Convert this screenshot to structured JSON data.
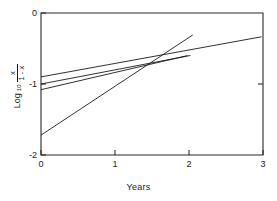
{
  "chart_data": {
    "type": "line",
    "title": "",
    "xlabel": "Years",
    "ylabel": "Log10 x/(1-x)",
    "ylabel_parts": {
      "prefix": "Log",
      "subscript": "10",
      "numerator": "x",
      "denominator": "1 - x"
    },
    "xlim": [
      0,
      3
    ],
    "ylim": [
      -2,
      0
    ],
    "xticks": [
      0,
      1,
      2,
      3
    ],
    "xtick_labels": [
      "0",
      "1",
      "2",
      "3"
    ],
    "yticks": [
      0,
      -1,
      -2
    ],
    "ytick_labels": [
      "0",
      "-1",
      "-2"
    ],
    "grid": false,
    "legend": "none",
    "line_color": "#1a1a1a",
    "series": [
      {
        "name": "line-1",
        "points": [
          [
            0.0,
            -0.9
          ],
          [
            2.98,
            -0.335
          ]
        ]
      },
      {
        "name": "line-2",
        "points": [
          [
            0.0,
            -1.0
          ],
          [
            2.02,
            -0.598
          ]
        ]
      },
      {
        "name": "line-3",
        "points": [
          [
            0.0,
            -1.08
          ],
          [
            1.98,
            -0.6
          ]
        ]
      },
      {
        "name": "line-4",
        "points": [
          [
            0.0,
            -1.72
          ],
          [
            2.05,
            -0.31
          ]
        ]
      }
    ]
  }
}
